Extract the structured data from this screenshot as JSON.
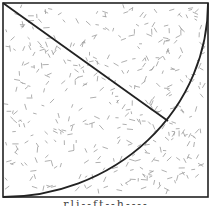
{
  "figure": {
    "square": {
      "x": 3,
      "y": 3,
      "width": 205,
      "height": 194,
      "stroke": "#222222",
      "stroke_width": 1.6
    },
    "diagonal": {
      "x1": 3,
      "y1": 3,
      "x2": 168,
      "y2": 121,
      "stroke": "#222222",
      "stroke_width": 1.8
    },
    "arc": {
      "start_x": 3,
      "start_y": 197,
      "end_x": 208,
      "end_y": 3,
      "radius": 205,
      "stroke": "#222222",
      "stroke_width": 1.8
    },
    "texture": {
      "count": 420,
      "color": "#9a9a9a",
      "seed": 7
    }
  },
  "caption": {
    "text": "rli--ft--h----"
  }
}
